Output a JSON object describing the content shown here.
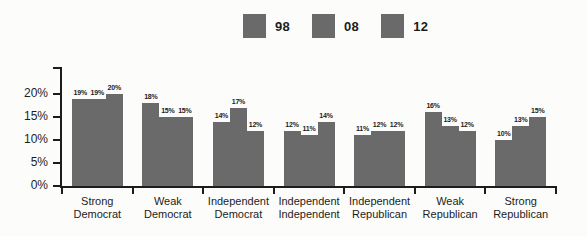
{
  "chart_data": {
    "type": "bar",
    "title": "",
    "xlabel": "",
    "ylabel": "",
    "categories": [
      "Strong Democrat",
      "Weak Democrat",
      "Independent Democrat",
      "Independent Independent",
      "Independent Republican",
      "Weak Republican",
      "Strong Republican"
    ],
    "series": [
      {
        "name": "98",
        "values": [
          19,
          18,
          14,
          12,
          11,
          16,
          10
        ]
      },
      {
        "name": "08",
        "values": [
          19,
          15,
          17,
          11,
          12,
          13,
          13
        ]
      },
      {
        "name": "12",
        "values": [
          20,
          15,
          12,
          14,
          12,
          12,
          15
        ]
      }
    ],
    "value_suffix": "%",
    "y_ticks": [
      {
        "label": "0%",
        "value": 0
      },
      {
        "label": "5%",
        "value": 5
      },
      {
        "label": "10%",
        "value": 10
      },
      {
        "label": "15%",
        "value": 15
      },
      {
        "label": "20%",
        "value": 20
      }
    ],
    "ylim": [
      0,
      25
    ],
    "grid": false,
    "legend_position": "top",
    "bar_color": "#6a6a6a",
    "axis_color": "#1c1c1c",
    "label_color": "#1c1c1c"
  }
}
